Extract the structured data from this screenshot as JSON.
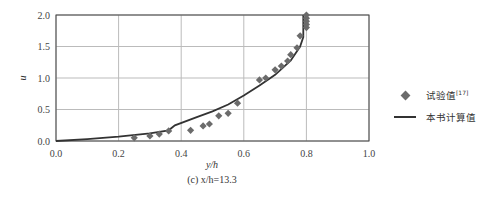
{
  "chart_data": {
    "type": "scatter+line",
    "title": "",
    "caption": "(c) x/h=13.3",
    "xlabel": "y/h",
    "ylabel": "u",
    "xlim": [
      0.0,
      1.0
    ],
    "ylim": [
      0.0,
      2.0
    ],
    "xticks": [
      "0.0",
      "0.2",
      "0.4",
      "0.6",
      "0.8",
      "1.0"
    ],
    "yticks": [
      "0.0",
      "0.5",
      "1.0",
      "1.5",
      "2.0"
    ],
    "grid": true,
    "legend_position": "right",
    "series": [
      {
        "name": "试验值[17]",
        "kind": "scatter",
        "marker": "diamond",
        "color": "#6b6b6b",
        "x": [
          0.25,
          0.3,
          0.33,
          0.36,
          0.43,
          0.47,
          0.49,
          0.52,
          0.55,
          0.58,
          0.65,
          0.67,
          0.7,
          0.72,
          0.74,
          0.75,
          0.77,
          0.78,
          0.8,
          0.8,
          0.8,
          0.8,
          0.8
        ],
        "y": [
          0.05,
          0.08,
          0.11,
          0.16,
          0.17,
          0.24,
          0.27,
          0.4,
          0.44,
          0.6,
          0.97,
          1.0,
          1.13,
          1.19,
          1.27,
          1.37,
          1.48,
          1.67,
          1.8,
          1.85,
          1.9,
          1.95,
          2.0
        ]
      },
      {
        "name": "本书计算值",
        "kind": "line",
        "color": "#333333",
        "x": [
          0.0,
          0.1,
          0.2,
          0.3,
          0.36,
          0.38,
          0.45,
          0.5,
          0.55,
          0.6,
          0.65,
          0.7,
          0.75,
          0.78,
          0.79,
          0.79,
          0.79
        ],
        "y": [
          0.0,
          0.03,
          0.07,
          0.12,
          0.17,
          0.25,
          0.38,
          0.47,
          0.58,
          0.72,
          0.88,
          1.05,
          1.28,
          1.5,
          1.65,
          1.8,
          2.0
        ]
      }
    ]
  },
  "legend": {
    "items": [
      {
        "label": "试验值",
        "sup": "[17]"
      },
      {
        "label": "本书计算值",
        "sup": ""
      }
    ]
  }
}
